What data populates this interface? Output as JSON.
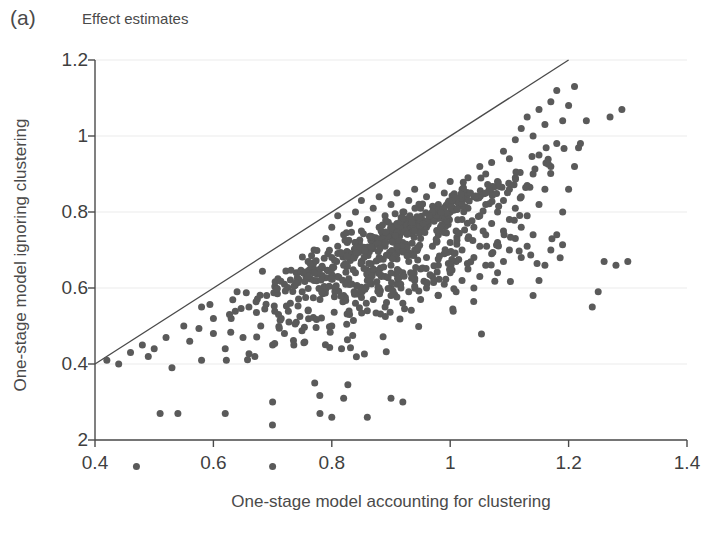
{
  "panel": {
    "letter": "(a)",
    "title": "Effect estimates"
  },
  "chart_data": {
    "type": "scatter",
    "title": "Effect estimates",
    "xlabel": "One-stage model accounting for clustering",
    "ylabel": "One-stage model ignoring clustering",
    "xlim": [
      0.4,
      1.4
    ],
    "ylim": [
      0.2,
      1.2
    ],
    "xticks": [
      0.4,
      0.6,
      0.8,
      1,
      1.2,
      1.4
    ],
    "xtick_labels": [
      "0.4",
      "0.6",
      "0.8",
      "1",
      "1.2",
      "1.4"
    ],
    "yticks": [
      0.2,
      0.4,
      0.6,
      0.8,
      1,
      1.2
    ],
    "ytick_labels": [
      "2",
      "0.4",
      "0.6",
      "0.8",
      "1",
      "1.2"
    ],
    "grid": "faint-horizontal",
    "legend": "none",
    "marker": {
      "shape": "circle",
      "color": "#5a5a5a",
      "size_px": 7
    },
    "reference_line": {
      "name": "identity-line",
      "equation": "y = x",
      "from": [
        0.4,
        0.4
      ],
      "to": [
        1.2,
        1.2
      ],
      "color": "#4a4a4a",
      "width_px": 1.3
    },
    "n_points": 820,
    "points": [
      [
        0.47,
        0.13
      ],
      [
        0.7,
        0.13
      ],
      [
        0.51,
        0.27
      ],
      [
        0.54,
        0.27
      ],
      [
        0.62,
        0.27
      ],
      [
        0.7,
        0.3
      ],
      [
        0.78,
        0.27
      ],
      [
        0.8,
        0.26
      ],
      [
        0.82,
        0.31
      ],
      [
        0.86,
        0.26
      ],
      [
        0.9,
        0.31
      ],
      [
        0.92,
        0.3
      ],
      [
        0.46,
        0.43
      ],
      [
        0.49,
        0.42
      ],
      [
        0.53,
        0.39
      ],
      [
        0.56,
        0.46
      ],
      [
        0.58,
        0.41
      ],
      [
        0.6,
        0.48
      ],
      [
        0.62,
        0.44
      ],
      [
        0.63,
        0.52
      ],
      [
        0.65,
        0.47
      ],
      [
        0.66,
        0.55
      ],
      [
        0.67,
        0.42
      ],
      [
        0.68,
        0.5
      ],
      [
        0.69,
        0.58
      ],
      [
        0.7,
        0.45
      ],
      [
        0.71,
        0.53
      ],
      [
        0.72,
        0.61
      ],
      [
        0.72,
        0.48
      ],
      [
        0.73,
        0.56
      ],
      [
        0.74,
        0.64
      ],
      [
        0.74,
        0.51
      ],
      [
        0.75,
        0.59
      ],
      [
        0.76,
        0.67
      ],
      [
        0.76,
        0.54
      ],
      [
        0.77,
        0.62
      ],
      [
        0.77,
        0.7
      ],
      [
        0.78,
        0.57
      ],
      [
        0.78,
        0.65
      ],
      [
        0.79,
        0.73
      ],
      [
        0.79,
        0.6
      ],
      [
        0.8,
        0.68
      ],
      [
        0.8,
        0.76
      ],
      [
        0.8,
        0.5
      ],
      [
        0.81,
        0.63
      ],
      [
        0.81,
        0.71
      ],
      [
        0.81,
        0.79
      ],
      [
        0.82,
        0.58
      ],
      [
        0.82,
        0.66
      ],
      [
        0.82,
        0.74
      ],
      [
        0.83,
        0.53
      ],
      [
        0.83,
        0.61
      ],
      [
        0.83,
        0.69
      ],
      [
        0.83,
        0.77
      ],
      [
        0.84,
        0.56
      ],
      [
        0.84,
        0.64
      ],
      [
        0.84,
        0.72
      ],
      [
        0.84,
        0.8
      ],
      [
        0.85,
        0.59
      ],
      [
        0.85,
        0.67
      ],
      [
        0.85,
        0.75
      ],
      [
        0.85,
        0.83
      ],
      [
        0.86,
        0.54
      ],
      [
        0.86,
        0.62
      ],
      [
        0.86,
        0.7
      ],
      [
        0.86,
        0.78
      ],
      [
        0.87,
        0.57
      ],
      [
        0.87,
        0.65
      ],
      [
        0.87,
        0.73
      ],
      [
        0.87,
        0.81
      ],
      [
        0.88,
        0.6
      ],
      [
        0.88,
        0.68
      ],
      [
        0.88,
        0.76
      ],
      [
        0.88,
        0.84
      ],
      [
        0.89,
        0.55
      ],
      [
        0.89,
        0.63
      ],
      [
        0.89,
        0.71
      ],
      [
        0.89,
        0.79
      ],
      [
        0.9,
        0.58
      ],
      [
        0.9,
        0.66
      ],
      [
        0.9,
        0.74
      ],
      [
        0.9,
        0.82
      ],
      [
        0.91,
        0.61
      ],
      [
        0.91,
        0.69
      ],
      [
        0.91,
        0.77
      ],
      [
        0.91,
        0.85
      ],
      [
        0.92,
        0.56
      ],
      [
        0.92,
        0.64
      ],
      [
        0.92,
        0.72
      ],
      [
        0.92,
        0.8
      ],
      [
        0.93,
        0.59
      ],
      [
        0.93,
        0.67
      ],
      [
        0.93,
        0.75
      ],
      [
        0.93,
        0.83
      ],
      [
        0.94,
        0.62
      ],
      [
        0.94,
        0.7
      ],
      [
        0.94,
        0.78
      ],
      [
        0.94,
        0.86
      ],
      [
        0.95,
        0.57
      ],
      [
        0.95,
        0.65
      ],
      [
        0.95,
        0.73
      ],
      [
        0.95,
        0.81
      ],
      [
        0.96,
        0.6
      ],
      [
        0.96,
        0.68
      ],
      [
        0.96,
        0.76
      ],
      [
        0.96,
        0.84
      ],
      [
        0.97,
        0.63
      ],
      [
        0.97,
        0.71
      ],
      [
        0.97,
        0.79
      ],
      [
        0.97,
        0.87
      ],
      [
        0.98,
        0.58
      ],
      [
        0.98,
        0.66
      ],
      [
        0.98,
        0.74
      ],
      [
        0.98,
        0.82
      ],
      [
        0.99,
        0.61
      ],
      [
        0.99,
        0.69
      ],
      [
        0.99,
        0.77
      ],
      [
        0.99,
        0.85
      ],
      [
        1.0,
        0.64
      ],
      [
        1.0,
        0.72
      ],
      [
        1.0,
        0.8
      ],
      [
        1.0,
        0.88
      ],
      [
        1.01,
        0.59
      ],
      [
        1.01,
        0.67
      ],
      [
        1.01,
        0.75
      ],
      [
        1.01,
        0.83
      ],
      [
        1.02,
        0.62
      ],
      [
        1.02,
        0.7
      ],
      [
        1.02,
        0.78
      ],
      [
        1.02,
        0.86
      ],
      [
        1.03,
        0.65
      ],
      [
        1.03,
        0.73
      ],
      [
        1.03,
        0.81
      ],
      [
        1.03,
        0.89
      ],
      [
        1.04,
        0.6
      ],
      [
        1.04,
        0.68
      ],
      [
        1.04,
        0.76
      ],
      [
        1.04,
        0.84
      ],
      [
        1.05,
        0.63
      ],
      [
        1.05,
        0.71
      ],
      [
        1.05,
        0.79
      ],
      [
        1.05,
        0.92
      ],
      [
        1.06,
        0.66
      ],
      [
        1.06,
        0.74
      ],
      [
        1.06,
        0.82
      ],
      [
        1.06,
        0.9
      ],
      [
        1.07,
        0.69
      ],
      [
        1.07,
        0.77
      ],
      [
        1.07,
        0.85
      ],
      [
        1.07,
        0.93
      ],
      [
        1.08,
        0.64
      ],
      [
        1.08,
        0.72
      ],
      [
        1.08,
        0.8
      ],
      [
        1.08,
        0.88
      ],
      [
        1.09,
        0.67
      ],
      [
        1.09,
        0.75
      ],
      [
        1.09,
        0.83
      ],
      [
        1.09,
        0.96
      ],
      [
        1.1,
        0.7
      ],
      [
        1.1,
        0.78
      ],
      [
        1.1,
        0.86
      ],
      [
        1.1,
        0.94
      ],
      [
        1.11,
        0.73
      ],
      [
        1.11,
        0.81
      ],
      [
        1.11,
        0.89
      ],
      [
        1.11,
        0.99
      ],
      [
        1.12,
        0.68
      ],
      [
        1.12,
        0.76
      ],
      [
        1.12,
        0.84
      ],
      [
        1.12,
        1.02
      ],
      [
        1.13,
        0.71
      ],
      [
        1.13,
        0.79
      ],
      [
        1.13,
        0.87
      ],
      [
        1.13,
        1.05
      ],
      [
        1.14,
        0.58
      ],
      [
        1.14,
        0.74
      ],
      [
        1.14,
        0.9
      ],
      [
        1.14,
        1.0
      ],
      [
        1.15,
        0.62
      ],
      [
        1.15,
        0.82
      ],
      [
        1.15,
        0.95
      ],
      [
        1.15,
        1.07
      ],
      [
        1.16,
        0.66
      ],
      [
        1.16,
        0.86
      ],
      [
        1.16,
        1.03
      ],
      [
        1.17,
        0.7
      ],
      [
        1.17,
        0.92
      ],
      [
        1.17,
        1.09
      ],
      [
        1.18,
        0.74
      ],
      [
        1.18,
        0.98
      ],
      [
        1.18,
        1.12
      ],
      [
        1.19,
        0.8
      ],
      [
        1.19,
        1.04
      ],
      [
        1.2,
        0.86
      ],
      [
        1.2,
        1.08
      ],
      [
        1.21,
        0.92
      ],
      [
        1.21,
        1.13
      ],
      [
        1.22,
        0.98
      ],
      [
        1.23,
        1.04
      ],
      [
        1.24,
        0.55
      ],
      [
        1.25,
        0.59
      ],
      [
        1.26,
        0.67
      ],
      [
        1.28,
        0.66
      ],
      [
        1.3,
        0.67
      ],
      [
        1.27,
        1.05
      ],
      [
        1.29,
        1.07
      ],
      [
        0.6,
        0.52
      ],
      [
        0.64,
        0.59
      ],
      [
        0.58,
        0.55
      ],
      [
        0.55,
        0.5
      ],
      [
        0.52,
        0.47
      ],
      [
        0.5,
        0.44
      ],
      [
        0.48,
        0.45
      ],
      [
        0.44,
        0.4
      ],
      [
        0.42,
        0.41
      ]
    ]
  }
}
